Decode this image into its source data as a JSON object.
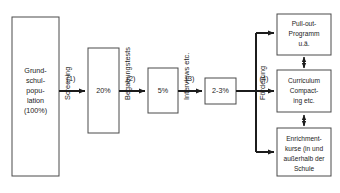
{
  "diagram": {
    "boxes": [
      {
        "id": "population",
        "lines": [
          "Grund-",
          "schul-",
          "popu-",
          "lation",
          "(100%)"
        ]
      },
      {
        "id": "stage-20",
        "lines": [
          "20%"
        ]
      },
      {
        "id": "stage-5",
        "lines": [
          "5%"
        ]
      },
      {
        "id": "stage-2-3",
        "lines": [
          "2-3%"
        ]
      },
      {
        "id": "pull-out",
        "lines": [
          "Pull-out-",
          "Programm",
          "u.ä."
        ]
      },
      {
        "id": "curriculum",
        "lines": [
          "Curriculum",
          "Compact-",
          "ing etc."
        ]
      },
      {
        "id": "enrichment",
        "lines": [
          "Enrichment-",
          "kurse (in und",
          "außerhalb der",
          "Schule"
        ]
      }
    ],
    "steps": [
      {
        "number": "(1)",
        "label": "Screening"
      },
      {
        "number": "(2)",
        "label": "Begabungstests"
      },
      {
        "number": "(3)",
        "label": "Interviews etc."
      },
      {
        "number": "(4)",
        "label": "Förderung"
      }
    ],
    "colors": {
      "box_stroke": "#4a4a4a",
      "line": "#1c1c1c",
      "text": "#1c1c1c",
      "background": "#ffffff"
    }
  }
}
